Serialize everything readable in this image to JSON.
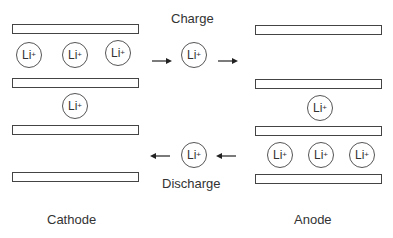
{
  "diagram": {
    "title_charge": "Charge",
    "title_discharge": "Discharge",
    "cathode_label": "Cathode",
    "anode_label": "Anode",
    "ion_text": "Li",
    "ion_charge": "+",
    "cathode": {
      "plates": 4,
      "ions_between_plates_1_2": 3,
      "ions_between_plates_2_3": 1
    },
    "anode": {
      "plates": 4,
      "ions_between_plates_2_3": 1,
      "ions_between_plates_3_4": 3
    },
    "flows": [
      {
        "name": "charge",
        "direction": "cathode-to-anode",
        "ion_count": 1
      },
      {
        "name": "discharge",
        "direction": "anode-to-cathode",
        "ion_count": 1
      }
    ]
  }
}
